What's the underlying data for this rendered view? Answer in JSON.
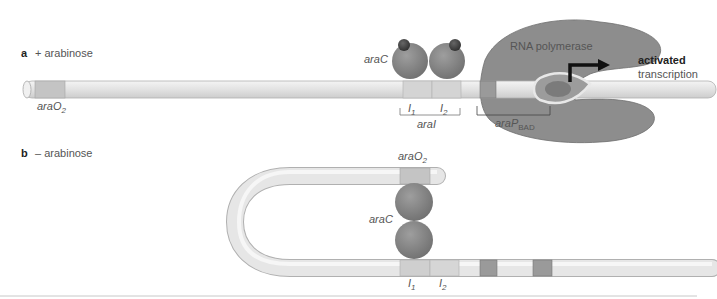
{
  "panel_a": {
    "letter": "a",
    "condition": "+ arabinose",
    "labels": {
      "araO2": "araO",
      "araO2_sub": "2",
      "araC": "araC",
      "I1": "I",
      "I1_sub": "1",
      "I2": "I",
      "I2_sub": "2",
      "araI": "araI",
      "araPBAD": "araP",
      "araPBAD_sub": "BAD",
      "rna_polymerase": "RNA polymerase",
      "activated": "activated",
      "transcription": "transcription"
    }
  },
  "panel_b": {
    "letter": "b",
    "condition": "– arabinose",
    "labels": {
      "araO2": "araO",
      "araO2_sub": "2",
      "araC": "araC",
      "I1": "I",
      "I1_sub": "1",
      "I2": "I",
      "I2_sub": "2"
    }
  },
  "colors": {
    "dna": "#e6e6e6",
    "dna_edge": "#b5b5b5",
    "site_light": "#cfcfcf",
    "site_dark": "#8f8f8f",
    "protein": "#8a8a8a",
    "polymerase": "#8c8c8c",
    "arabinose": "#4a4a4a",
    "arrow": "#111111"
  }
}
